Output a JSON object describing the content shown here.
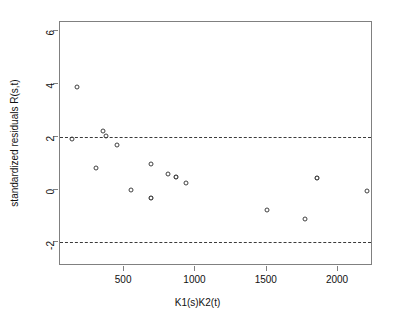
{
  "chart_data": {
    "type": "scatter",
    "title": "",
    "xlabel": "K1(s)K2(t)",
    "ylabel": "standardized residuals R(s,t)",
    "xlim": [
      50,
      2245
    ],
    "ylim": [
      -2.9,
      6.35
    ],
    "xticks": [
      500,
      1000,
      1500,
      2000
    ],
    "yticks": [
      6,
      4,
      2,
      0,
      -2
    ],
    "xtick_labels": [
      "500",
      "1000",
      "1500",
      "2000"
    ],
    "ytick_labels": [
      "6",
      "4",
      "2",
      "0",
      "-2"
    ],
    "grid": false,
    "legend": null,
    "reference_lines": [
      {
        "name": "upper-threshold",
        "y": 2,
        "style": "dashed"
      },
      {
        "name": "lower-threshold",
        "y": -2,
        "style": "dashed"
      }
    ],
    "marker": "open-circle",
    "points": [
      {
        "x": 166,
        "y": 3.89,
        "bold": false
      },
      {
        "x": 134,
        "y": 1.93,
        "bold": false
      },
      {
        "x": 349,
        "y": 2.2,
        "bold": false
      },
      {
        "x": 371,
        "y": 2.04,
        "bold": false
      },
      {
        "x": 450,
        "y": 1.67,
        "bold": false
      },
      {
        "x": 299,
        "y": 0.82,
        "bold": false
      },
      {
        "x": 545,
        "y": -0.03,
        "bold": false
      },
      {
        "x": 688,
        "y": 0.96,
        "bold": false
      },
      {
        "x": 688,
        "y": -0.33,
        "bold": true
      },
      {
        "x": 806,
        "y": 0.58,
        "bold": false
      },
      {
        "x": 861,
        "y": 0.47,
        "bold": true
      },
      {
        "x": 937,
        "y": 0.23,
        "bold": false
      },
      {
        "x": 1502,
        "y": -0.76,
        "bold": false
      },
      {
        "x": 1771,
        "y": -1.1,
        "bold": false
      },
      {
        "x": 1855,
        "y": 0.42,
        "bold": true
      },
      {
        "x": 2205,
        "y": -0.07,
        "bold": false
      }
    ]
  }
}
